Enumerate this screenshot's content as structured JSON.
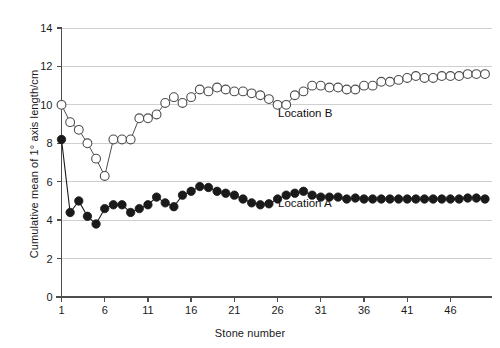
{
  "chart_data": {
    "type": "line",
    "title": "",
    "subtitle": "",
    "xlabel": "Stone number",
    "ylabel": "Cumulative mean of 1° axis length/cm",
    "xlim": [
      1,
      50
    ],
    "ylim": [
      0,
      14
    ],
    "xticks": [
      1,
      6,
      11,
      16,
      21,
      26,
      31,
      36,
      41,
      46
    ],
    "yticks": [
      0,
      2,
      4,
      6,
      8,
      10,
      12,
      14
    ],
    "grid": "horizontal",
    "legend_position": "inline-annotation",
    "annotations": [
      {
        "text": "Location B",
        "x": 26,
        "y": 10.0
      },
      {
        "text": "Location A",
        "x": 26,
        "y": 5.3
      }
    ],
    "x": [
      1,
      2,
      3,
      4,
      5,
      6,
      7,
      8,
      9,
      10,
      11,
      12,
      13,
      14,
      15,
      16,
      17,
      18,
      19,
      20,
      21,
      22,
      23,
      24,
      25,
      26,
      27,
      28,
      29,
      30,
      31,
      32,
      33,
      34,
      35,
      36,
      37,
      38,
      39,
      40,
      41,
      42,
      43,
      44,
      45,
      46,
      47,
      48,
      49,
      50
    ],
    "series": [
      {
        "name": "Location B",
        "marker": "open-circle",
        "color": "#ffffff",
        "edge_color": "#333333",
        "values": [
          10.0,
          9.1,
          8.7,
          8.0,
          7.2,
          6.3,
          8.2,
          8.2,
          8.2,
          9.3,
          9.3,
          9.5,
          10.1,
          10.4,
          10.1,
          10.4,
          10.8,
          10.7,
          10.9,
          10.8,
          10.7,
          10.7,
          10.6,
          10.5,
          10.3,
          10.0,
          10.0,
          10.5,
          10.7,
          11.0,
          11.0,
          10.9,
          10.9,
          10.8,
          10.8,
          11.0,
          11.0,
          11.2,
          11.2,
          11.3,
          11.4,
          11.5,
          11.4,
          11.4,
          11.5,
          11.5,
          11.5,
          11.6,
          11.6,
          11.6
        ]
      },
      {
        "name": "Location A",
        "marker": "filled-circle",
        "color": "#1a1a1a",
        "edge_color": "#1a1a1a",
        "values": [
          8.2,
          4.4,
          5.0,
          4.2,
          3.8,
          4.6,
          4.8,
          4.8,
          4.4,
          4.6,
          4.8,
          5.2,
          4.9,
          4.7,
          5.3,
          5.5,
          5.75,
          5.7,
          5.5,
          5.4,
          5.3,
          5.1,
          4.9,
          4.8,
          4.85,
          5.1,
          5.3,
          5.4,
          5.5,
          5.3,
          5.2,
          5.2,
          5.2,
          5.1,
          5.15,
          5.1,
          5.1,
          5.1,
          5.1,
          5.1,
          5.1,
          5.1,
          5.1,
          5.1,
          5.1,
          5.1,
          5.1,
          5.15,
          5.15,
          5.1
        ]
      }
    ]
  },
  "labels": {
    "x_axis_title": "Stone number",
    "y_axis_title": "Cumulative mean of 1° axis length/cm",
    "series_b": "Location B",
    "series_a": "Location A"
  },
  "colors": {
    "axis": "#4d4d4d",
    "grid": "#cfcfcf",
    "series_a": "#1a1a1a",
    "series_b_edge": "#4d4d4d",
    "series_b_fill": "#ffffff",
    "text": "#1a1a1a",
    "background": "#ffffff"
  }
}
